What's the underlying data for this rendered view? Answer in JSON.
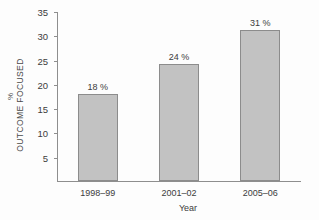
{
  "chart_data": {
    "type": "bar",
    "title": "",
    "categories": [
      "1998–99",
      "2001–02",
      "2005–06"
    ],
    "values": [
      18,
      24,
      31
    ],
    "data_labels": [
      "18 %",
      "24 %",
      "31 %"
    ],
    "xlabel": "Year",
    "ylabel": "OUTCOME FOCUSED",
    "yunit": "%",
    "ylim": [
      0,
      35
    ],
    "yticks": [
      5,
      10,
      15,
      20,
      25,
      30,
      35
    ],
    "ytick_labels": [
      "5",
      "10",
      "15",
      "20",
      "25",
      "30",
      "35"
    ],
    "grid": false,
    "legend": false,
    "bar_color": "#c2c2c2",
    "bar_edge_color": "#8c8c8c",
    "axis_color": "#8e8e8e",
    "text_color": "#3c3c3c",
    "background": "#fdfdfd"
  }
}
